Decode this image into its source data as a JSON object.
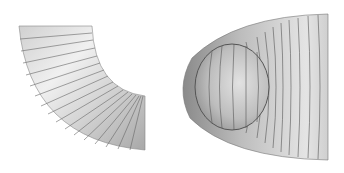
{
  "figure": {
    "panels": [
      {
        "name": "pipe-elbow",
        "shape": "quarter-torus elbow"
      },
      {
        "name": "pipe-end-view",
        "shape": "tapered tube with circular opening"
      }
    ],
    "colors": {
      "background": "#ffffff",
      "surface_light": "#e6e6e6",
      "surface_mid": "#bdbdbd",
      "surface_dark": "#7a7a7a",
      "seam_lines": "#555555"
    }
  }
}
